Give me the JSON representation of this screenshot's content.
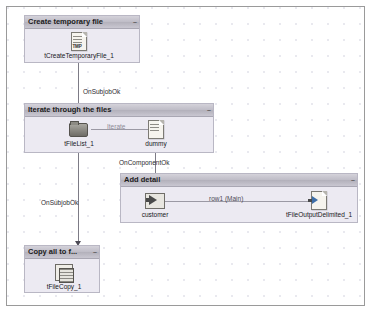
{
  "canvas": {
    "grid": "dotted",
    "background_color": "#ffffff",
    "border_color": "#9a9a9a"
  },
  "subjobs": [
    {
      "id": "create-temporary-file",
      "title": "Create temporary file",
      "collapse_glyph": "–",
      "components": [
        {
          "id": "tcreatetemporaryfile-1",
          "label": "tCreateTemporaryFile_1",
          "icon": "temp-file-icon",
          "icon_text": "TMP"
        }
      ]
    },
    {
      "id": "iterate-through-the-files",
      "title": "Iterate through the files",
      "collapse_glyph": "–",
      "components": [
        {
          "id": "tfilelist-1",
          "label": "tFileList_1",
          "icon": "folder-list-icon"
        },
        {
          "id": "dummy",
          "label": "dummy",
          "icon": "document-icon"
        }
      ],
      "links": [
        {
          "id": "iterate-link",
          "label": "Iterate",
          "style": "muted"
        }
      ]
    },
    {
      "id": "add-detail",
      "title": "Add detail",
      "collapse_glyph": "–",
      "components": [
        {
          "id": "customer",
          "label": "customer",
          "icon": "input-arrow-icon"
        },
        {
          "id": "tfileoutputdelimited-1",
          "label": "tFileOutputDelimited_1",
          "icon": "output-file-icon"
        }
      ],
      "links": [
        {
          "id": "row1-main-link",
          "label": "row1 (Main)",
          "style": "row"
        }
      ]
    },
    {
      "id": "copy-all-to-folder",
      "title": "Copy all to f...",
      "collapse_glyph": "–",
      "components": [
        {
          "id": "tfilecopy-1",
          "label": "tFileCopy_1",
          "icon": "file-copy-icon"
        }
      ]
    }
  ],
  "trigger_links": [
    {
      "id": "onsubjobok-1",
      "label": "OnSubjobOk"
    },
    {
      "id": "oncomponentok-1",
      "label": "OnComponentOk"
    },
    {
      "id": "onsubjobok-2",
      "label": "OnSubjobOk"
    }
  ]
}
